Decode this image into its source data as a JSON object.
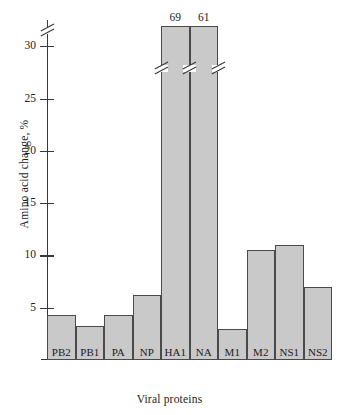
{
  "chart_data": {
    "type": "bar",
    "title": "",
    "xlabel": "Viral proteins",
    "ylabel": "Amino acid change, %",
    "categories": [
      "PB2",
      "PB1",
      "PA",
      "NP",
      "HA1",
      "NA",
      "M1",
      "M2",
      "NS1",
      "NS2"
    ],
    "values": [
      4.3,
      3.3,
      4.3,
      6.2,
      69,
      61,
      3.0,
      10.5,
      11.0,
      7.0
    ],
    "value_labels": [
      "",
      "",
      "",
      "",
      "69",
      "61",
      "",
      "",
      "",
      ""
    ],
    "ylim": [
      0,
      32.5
    ],
    "yticks": [
      5,
      10,
      15,
      20,
      25,
      30
    ],
    "ytick_labels": [
      "5",
      "10",
      "15",
      "20",
      "25",
      "30"
    ],
    "grid": false,
    "legend": false,
    "axis_break": {
      "present": true,
      "note": "y-axis broken above 30; HA1 and NA bars are truncated and annotated with their true values"
    },
    "colors": {
      "bar_fill": "#c9c9c9",
      "bar_edge": "#4a4a4c",
      "axis": "#38383a",
      "text": "#1b1b1b",
      "background": "#ffffff"
    }
  }
}
